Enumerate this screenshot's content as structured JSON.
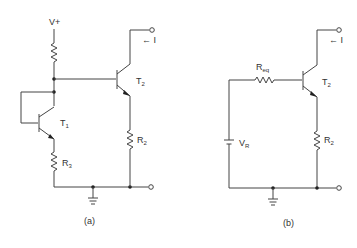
{
  "figure": {
    "type": "circuit-schematic",
    "colors": {
      "line": "#444444",
      "text": "#333333",
      "background": "#ffffff"
    },
    "panels": [
      {
        "id": "a",
        "caption": "(a)",
        "labels": {
          "supply": "V+",
          "t1": "T",
          "t1_sub": "1",
          "t2": "T",
          "t2_sub": "2",
          "r3": "R",
          "r3_sub": "3",
          "r2": "R",
          "r2_sub": "2",
          "current": "← I"
        },
        "components": [
          "resistor-top",
          "transistor-T1-diode-connected",
          "transistor-T2",
          "resistor-R3",
          "resistor-R2",
          "ground"
        ]
      },
      {
        "id": "b",
        "caption": "(b)",
        "labels": {
          "req": "R",
          "req_sub": "eq",
          "vr": "V",
          "vr_sub": "R",
          "t2": "T",
          "t2_sub": "2",
          "r2": "R",
          "r2_sub": "2",
          "current": "← I"
        },
        "components": [
          "resistor-Req",
          "battery-VR",
          "transistor-T2",
          "resistor-R2",
          "ground"
        ]
      }
    ]
  }
}
